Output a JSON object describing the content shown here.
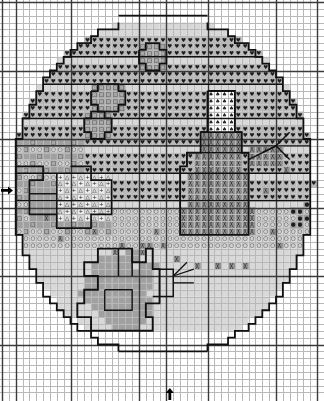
{
  "chart": {
    "title": "Easter Egg Cross Stitch Pattern Chart",
    "type": "cross-stitch-pattern-grid",
    "grid": {
      "columns": 46,
      "rows": 57,
      "cell_size_px": 6.85,
      "origin_x_px": 2.0,
      "origin_y_px": 2.0,
      "minor_line_color": "#b8b8b8",
      "major_line_color": "#3a3a3a",
      "major_every": 10,
      "background_color": "#ffffff"
    },
    "center_markers": {
      "left_arrow": {
        "label": "center-row-marker",
        "row": 27,
        "glyph": "▶"
      },
      "bottom_arrow": {
        "label": "center-column-marker",
        "column": 24,
        "glyph": "▲"
      }
    },
    "symbol_key": [
      {
        "id": "heart",
        "glyph": "♥",
        "fill": "#b9b9b9",
        "name": "heart-symbol"
      },
      {
        "id": "vee",
        "glyph": "V",
        "fill": "#c9c9c9",
        "name": "vee-symbol"
      },
      {
        "id": "square",
        "glyph": "□",
        "fill": "#a8a8a8",
        "name": "open-square-symbol"
      },
      {
        "id": "triangle",
        "glyph": "♠",
        "fill": "#ffffff",
        "name": "spade-symbol"
      },
      {
        "id": "crosshatch",
        "glyph": "╳",
        "fill": "#8f8f8f",
        "name": "crosshatch-symbol"
      },
      {
        "id": "dot",
        "glyph": "●",
        "fill": "#9a9a9a",
        "name": "filled-dot-symbol"
      },
      {
        "id": "circle",
        "glyph": "○",
        "fill": "#cfcfcf",
        "name": "open-circle-symbol"
      },
      {
        "id": "delta",
        "glyph": "△",
        "fill": "#d6d6d6",
        "name": "open-triangle-symbol"
      },
      {
        "id": "plus",
        "glyph": "+",
        "fill": "#ebebeb",
        "name": "plus-symbol"
      },
      {
        "id": "solid",
        "glyph": "",
        "fill": "#a0a0a0",
        "name": "solid-fill"
      },
      {
        "id": "light",
        "glyph": "",
        "fill": "#d8d8d8",
        "name": "light-fill"
      },
      {
        "id": "blank",
        "glyph": "",
        "fill": "#ffffff",
        "name": "blank-cell"
      }
    ]
  },
  "chart_data": {
    "type": "heatmap",
    "title": "Easter Egg Cross Stitch Pattern Chart",
    "xlabel": "",
    "ylabel": "",
    "grid": true,
    "legend_position": "none",
    "categories": [
      "heart",
      "vee",
      "square",
      "triangle",
      "crosshatch",
      "dot",
      "circle",
      "delta",
      "plus",
      "solid",
      "light",
      "blank"
    ],
    "x": [
      1,
      2,
      3,
      4,
      5,
      6,
      7,
      8,
      9,
      10,
      11,
      12,
      13,
      14,
      15,
      16,
      17,
      18,
      19,
      20,
      21,
      22,
      23,
      24,
      25,
      26,
      27,
      28,
      29,
      30,
      31,
      32,
      33,
      34,
      35,
      36,
      37,
      38,
      39,
      40,
      41,
      42,
      43,
      44,
      45,
      46
    ],
    "xlim": [
      1,
      46
    ],
    "ylim": [
      1,
      57
    ],
    "motifs": [
      {
        "name": "easter-egg-outline",
        "description": "large oval egg shape occupying most of the chart"
      },
      {
        "name": "decorative-bands",
        "description": "horizontal banded rows of heart and vee symbols across upper egg"
      },
      {
        "name": "snowman-figure",
        "description": "standing figure with spade-topped hat and crosshatch body, right of center"
      },
      {
        "name": "rabbit-figure",
        "description": "seated bunny holding carrot, lower left of center"
      },
      {
        "name": "confetti-dots",
        "description": "scattered filled dots at right margin"
      },
      {
        "name": "scattered-crosses",
        "description": "isolated crosshatch stitches below the egg band"
      }
    ],
    "rows": [
      "..............................................",
      "..............................................",
      "..............................................",
      "...................SSSSSSSSSSSSSSS............",
      "..............SSSSShSSSSSSSSSSSSSSSSSS........",
      "...........SSShhhhhhhhhhhhhhhhhhhhhhSSS.......",
      ".........SShhhhhhhhhhhhhhhhhhhhhhhhhhhSS......",
      "........Shhhhhhhhhhhhhhhhhhhhhhhhhhhhhh S....",
      ".......Shhhhh..h.....h.....hhhh..qqq..hhS.....",
      "......Shhhhhhhhhhhhhhhhhhhhhhhhh.qqqq.hhhS....",
      ".....Shhhhhhhhhhhhhhhhhhhhhhhhhh.qqqq.hhhhS...",
      ".....Shhhhhhhhhhhhhhhhhhhhhhhhhhh.qq.hhhhhS...",
      "....ShhhhhhhhhhhhhhhhhhhhhhhhhhhhhhhhhhhhhS..",
      "....Shhhhhhhhh..qqqqq..hhhhhhhhhhhhhhhhhhhS..",
      "...Shhhhhhhhhh.qqqqqqq.hhhhhhhhhhhhhhhhhhhhS.",
      "...Shhhhhhhhhh.qqqqqqq.hhhhhhhhhhhhhhhhhhhhS.",
      "...Shhhhhhhhhhh.qqqqq.hhhhhhhhhhhhhhhhhhhhhS.",
      "...ShhhhhhhhhhhhhhhhhhhhhhhhhhttttthhhhhhhhS.",
      "..Shhhhhhhh.qqqq.hhhhhhhhhhhhhtttttthhhhhhhhS",
      "..Shhhhhhhh.qqqqq.hhhhhhhhhhhhtttttthhhhhhhhS",
      "..Shhhhhhhhh.qqq.hhhhhhhhhhhhhtttttthhhhhhhhS",
      "..Sllllllllllllllllllllllllllltttttthxxxxxxxx",
      "..Slllllllllllllllllllllllllllcccccchxxxxxxxx",
      "..Slllllllllllllllllllllllllllccccccx.xxxxxxS",
      "..Sllllllllllllllllllllllllllccccccccx....xxS",
      "..Sllllllllllllllllllllllllllccccccccc...xxxS",
      "..Slllllllllllllllllllllllllccccccccccc..xxxS",
      "<.Slllllllllllllllllllllllllccccccccccc...xxS",
      "..Sllllllllllllllllllllllllcccccccccccc...xxS",
      "..Slllllllllllllllllllllllcccccccccccccc..xxS",
      "..Slllllllllllllllllllllllccccccccccccccc.ddd",
      "...Sllllllllllllllllllllllcccccccccccccc..ddd",
      "...Slllllllllllllllllllllcccccccccccccccx.ddd",
      "....Slllllllllllllllllllccccccccccccccccx..xS",
      "....Sllllllllllllllllllxccccccccccccccccx...S",
      ".....Slllllllllllx..xx.xcccccccccccccccc....S",
      ".....Sllllllllllx...x...cccccccccccccc.....S.",
      "......Sllllllx.....rr...xxxcccccxx.xx.....S..",
      ".......Sllllx.....rrrr..............x....S...",
      "........Sl.......rrrrr.....rr...........S....",
      ".........S......rrrrrrr...rrrr.........S.....",
      "..........S....rrr.rrrrr.rrr..........S......",
      "...........S...rrrrrrrrrrrr..........S.......",
      "............S..rrrrrrrrrrrr.........S........",
      ".............S.rrrrrrrrrrr.........S.........",
      "..............S.rrrrrrrrr.........S..........",
      "...............S..rrrrrr.........S...........",
      "................SS.rrrr.......SSS............",
      "..................SS.......SSS...............",
      "....................SSSSSSS..................",
      "..............................................",
      "..............................................",
      "..............................................",
      "..............................................",
      "..............................................",
      "..............................................",
      ".............^................................"
    ]
  }
}
